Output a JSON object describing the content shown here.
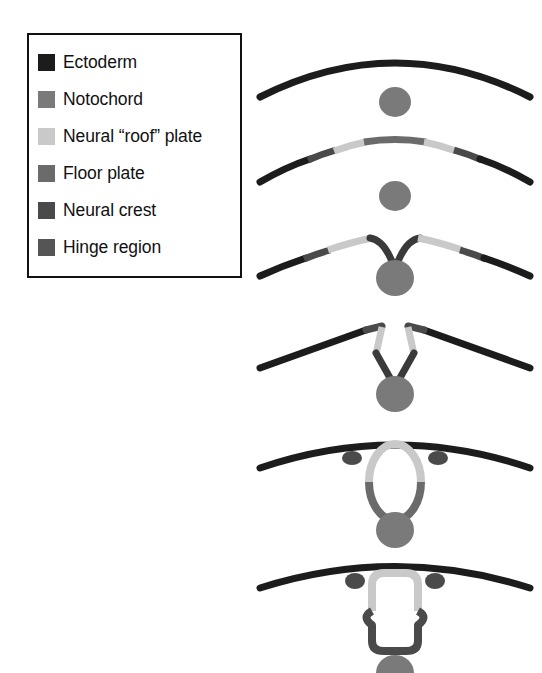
{
  "legend": {
    "items": [
      {
        "label": "Ectoderm",
        "key": "ectoderm",
        "color": "#1c1c1c"
      },
      {
        "label": "Notochord",
        "key": "notochord",
        "color": "#7a7a7a"
      },
      {
        "label": "Neural “roof” plate",
        "key": "roof_plate",
        "color": "#c9c9c9"
      },
      {
        "label": "Floor plate",
        "key": "floor_plate",
        "color": "#6b6b6b"
      },
      {
        "label": "Neural crest",
        "key": "neural_crest",
        "color": "#4a4a4a"
      },
      {
        "label": "Hinge region",
        "key": "hinge",
        "color": "#555555"
      }
    ]
  },
  "colors": {
    "ectoderm": "#1c1c1c",
    "notochord": "#7a7a7a",
    "roof_plate": "#c9c9c9",
    "floor_plate": "#6b6b6b",
    "neural_crest": "#4a4a4a",
    "hinge": "#555555",
    "background": "#ffffff",
    "border": "#111111"
  },
  "stages": [
    {
      "index": 1,
      "name": "flat-neural-plate",
      "caption": ""
    },
    {
      "index": 2,
      "name": "neural-plate-regions",
      "caption": ""
    },
    {
      "index": 3,
      "name": "neural-groove",
      "caption": ""
    },
    {
      "index": 4,
      "name": "neural-folds-elevating",
      "caption": ""
    },
    {
      "index": 5,
      "name": "neural-tube-closing",
      "caption": ""
    },
    {
      "index": 6,
      "name": "neural-tube-closed",
      "caption": ""
    }
  ]
}
